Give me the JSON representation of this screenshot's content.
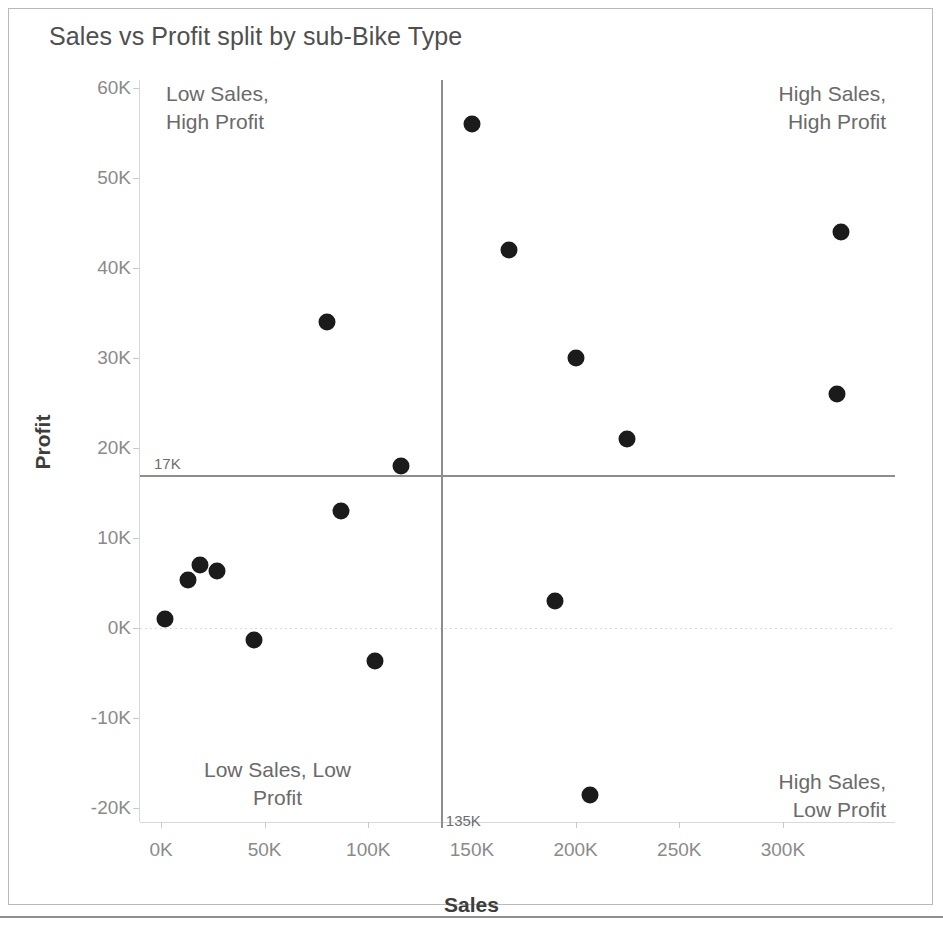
{
  "chart_data": {
    "type": "scatter",
    "title": "Sales vs Profit split by sub-Bike Type",
    "xlabel": "Sales",
    "ylabel": "Profit",
    "xlim": [
      -10000,
      355000
    ],
    "ylim": [
      -22000,
      62000
    ],
    "grid": false,
    "legend": "none",
    "x_ticks": [
      "0K",
      "50K",
      "100K",
      "150K",
      "200K",
      "250K",
      "300K"
    ],
    "x_tick_values": [
      0,
      50000,
      100000,
      150000,
      200000,
      250000,
      300000
    ],
    "y_ticks": [
      "60K",
      "50K",
      "40K",
      "30K",
      "20K",
      "10K",
      "0K",
      "-10K",
      "-20K"
    ],
    "y_tick_values": [
      60000,
      50000,
      40000,
      30000,
      20000,
      10000,
      0,
      -10000,
      -20000
    ],
    "reference_lines": [
      {
        "orientation": "horizontal",
        "value": 17000,
        "label": "17K"
      },
      {
        "orientation": "vertical",
        "value": 135000,
        "label": "135K"
      }
    ],
    "zero_line": {
      "orientation": "horizontal",
      "value": 0,
      "style": "dotted"
    },
    "points": [
      {
        "x": 2000,
        "y": 1000
      },
      {
        "x": 13000,
        "y": 5300
      },
      {
        "x": 19000,
        "y": 7000
      },
      {
        "x": 27000,
        "y": 6300
      },
      {
        "x": 45000,
        "y": -1300
      },
      {
        "x": 80000,
        "y": 34000
      },
      {
        "x": 87000,
        "y": 13000
      },
      {
        "x": 103000,
        "y": -3700
      },
      {
        "x": 116000,
        "y": 18000
      },
      {
        "x": 150000,
        "y": 56000
      },
      {
        "x": 168000,
        "y": 42000
      },
      {
        "x": 190000,
        "y": 3000
      },
      {
        "x": 200000,
        "y": 30000
      },
      {
        "x": 207000,
        "y": -18500
      },
      {
        "x": 225000,
        "y": 21000
      },
      {
        "x": 326000,
        "y": 26000
      },
      {
        "x": 328000,
        "y": 44000
      }
    ],
    "annotations": [
      {
        "id": "low-sales-high-profit",
        "text": "Low Sales,\nHigh Profit",
        "quadrant": "top-left"
      },
      {
        "id": "high-sales-high-profit",
        "text": "High Sales,\nHigh Profit",
        "quadrant": "top-right"
      },
      {
        "id": "low-sales-low-profit",
        "text": "Low Sales, Low\nProfit",
        "quadrant": "bottom-left"
      },
      {
        "id": "high-sales-low-profit",
        "text": "High Sales,\nLow Profit",
        "quadrant": "bottom-right"
      }
    ],
    "colors": {
      "marker": "#1b1b1b",
      "reference_line": "#8d8d8d",
      "axis_text": "#8a8a8a",
      "title_text": "#4f4f4f",
      "annotation_text": "#6a6a6a",
      "background": "#ffffff",
      "border": "#b9b9b9"
    }
  },
  "annotation_lines": {
    "tl1": "Low Sales,",
    "tl2": "High Profit",
    "tr1": "High Sales,",
    "tr2": "High Profit",
    "bl1": "Low Sales, Low",
    "bl2": "Profit",
    "br1": "High Sales,",
    "br2": "Low Profit"
  }
}
